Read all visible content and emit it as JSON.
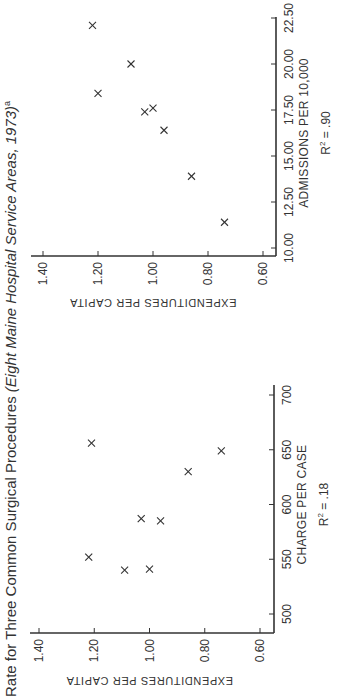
{
  "title": {
    "plain": "Rate for Three Common Surgical Procedures ",
    "italic": "(Eight Maine Hospital Service Areas, 1973)",
    "footnote_mark": "a"
  },
  "colors": {
    "ink": "#333333",
    "background": "#ffffff"
  },
  "chart_data": [
    {
      "type": "scatter",
      "title": "",
      "xlabel": "CHARGE PER CASE",
      "ylabel": "EXPENDITURES PER CAPITA",
      "annotation": "R² = .18",
      "r2_label": "R",
      "r2_sup": "2",
      "r2_value": " = .18",
      "xlim": [
        500,
        700
      ],
      "ylim": [
        0.6,
        1.4
      ],
      "xticks": [
        500,
        550,
        600,
        650,
        700
      ],
      "xtick_labels": [
        "500",
        "550",
        "600",
        "650",
        "700"
      ],
      "yticks": [
        0.6,
        0.8,
        1.0,
        1.2,
        1.4
      ],
      "ytick_labels": [
        "0.60",
        "0.80",
        "1.00",
        "1.20",
        "1.40"
      ],
      "grid": false,
      "marker": "×",
      "points": [
        {
          "x": 540,
          "y": 1.09
        },
        {
          "x": 541,
          "y": 1.0
        },
        {
          "x": 552,
          "y": 1.22
        },
        {
          "x": 585,
          "y": 0.96
        },
        {
          "x": 587,
          "y": 1.03
        },
        {
          "x": 630,
          "y": 0.86
        },
        {
          "x": 649,
          "y": 0.74
        },
        {
          "x": 656,
          "y": 1.21
        }
      ]
    },
    {
      "type": "scatter",
      "title": "",
      "xlabel": "ADMISSIONS PER 10,000",
      "ylabel": "EXPENDITURES PER CAPITA",
      "annotation": "R² = .90",
      "r2_label": "R",
      "r2_sup": "2",
      "r2_value": " = .90",
      "xlim": [
        10.0,
        22.5
      ],
      "ylim": [
        0.6,
        1.4
      ],
      "xticks": [
        10.0,
        12.5,
        15.0,
        17.5,
        20.0,
        22.5
      ],
      "xtick_labels": [
        "10.00",
        "12.50",
        "15.00",
        "17.50",
        "20.00",
        "22.50"
      ],
      "yticks": [
        0.6,
        0.8,
        1.0,
        1.2,
        1.4
      ],
      "ytick_labels": [
        "0.60",
        "0.80",
        "1.00",
        "1.20",
        "1.40"
      ],
      "grid": false,
      "marker": "×",
      "points": [
        {
          "x": 11.4,
          "y": 0.74
        },
        {
          "x": 13.9,
          "y": 0.86
        },
        {
          "x": 16.4,
          "y": 0.96
        },
        {
          "x": 17.4,
          "y": 1.03
        },
        {
          "x": 17.6,
          "y": 1.0
        },
        {
          "x": 18.4,
          "y": 1.2
        },
        {
          "x": 20.0,
          "y": 1.08
        },
        {
          "x": 22.1,
          "y": 1.22
        }
      ]
    }
  ]
}
